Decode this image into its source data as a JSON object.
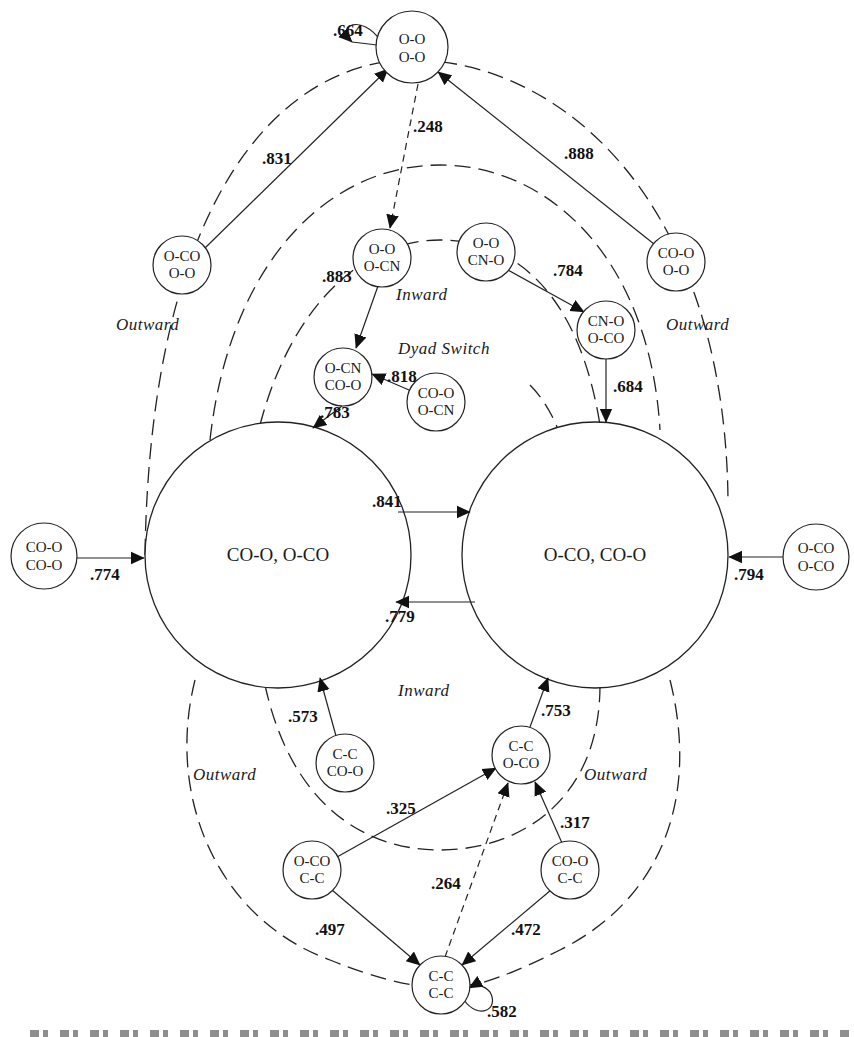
{
  "diagram": {
    "type": "state-transition-diagram",
    "states": {
      "oo_oo": {
        "line1": "O-O",
        "line2": "O-O"
      },
      "oo_ocn": {
        "line1": "O-O",
        "line2": "O-CN"
      },
      "oco_oo": {
        "line1": "O-CO",
        "line2": "O-O"
      },
      "oo_cno": {
        "line1": "O-O",
        "line2": "CN-O"
      },
      "coo_oo": {
        "line1": "CO-O",
        "line2": "O-O"
      },
      "cno_oco": {
        "line1": "CN-O",
        "line2": "O-CO"
      },
      "ocn_coo": {
        "line1": "O-CN",
        "line2": "CO-O"
      },
      "coo_ocn": {
        "line1": "CO-O",
        "line2": "O-CN"
      },
      "coo_coo": {
        "line1": "CO-O",
        "line2": "CO-O"
      },
      "oco_oco": {
        "line1": "O-CO",
        "line2": "O-CO"
      },
      "cc_coo": {
        "line1": "C-C",
        "line2": "CO-O"
      },
      "cc_oco": {
        "line1": "C-C",
        "line2": "O-CO"
      },
      "oco_cc": {
        "line1": "O-CO",
        "line2": "C-C"
      },
      "coo_cc": {
        "line1": "CO-O",
        "line2": "C-C"
      },
      "cc_cc": {
        "line1": "C-C",
        "line2": "C-C"
      },
      "big_left": {
        "label": "CO-O, O-CO"
      },
      "big_right": {
        "label": "O-CO, CO-O"
      }
    },
    "transitions": {
      "oo_self": ".664",
      "oo_to_oo_ocn": ".248",
      "oco_oo_to_oo": ".831",
      "coo_oo_to_oo": ".888",
      "oo_ocn_to_ocn_coo": ".883",
      "oo_cno_to_cno_oco": ".784",
      "cno_oco_to_right": ".684",
      "coo_ocn_to_ocn_coo": ".818",
      "ocn_coo_to_left": ".783",
      "left_to_right": ".841",
      "right_to_left": ".779",
      "coo_coo_to_left": ".774",
      "oco_oco_to_right": ".794",
      "cc_coo_to_left": ".573",
      "cc_oco_to_right": ".753",
      "oco_cc_to_cc_oco": ".325",
      "coo_cc_to_cc_oco": ".317",
      "cc_cc_to_cc_oco": ".264",
      "oco_cc_to_cc_cc": ".497",
      "coo_cc_to_cc_cc": ".472",
      "cc_self": ".582"
    },
    "regions": {
      "outward_top_left": "Outward",
      "outward_top_right": "Outward",
      "inward_top": "Inward",
      "dyad_switch": "Dyad Switch",
      "inward_bottom": "Inward",
      "outward_bottom_left": "Outward",
      "outward_bottom_right": "Outward"
    }
  }
}
